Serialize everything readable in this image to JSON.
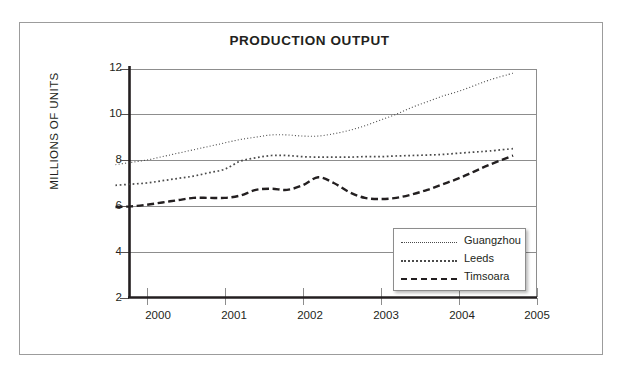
{
  "chart_data": {
    "type": "line",
    "title": "PRODUCTION OUTPUT",
    "xlabel": "",
    "ylabel": "MILLIONS OF UNITS",
    "xlim": [
      1999.78,
      2005
    ],
    "ylim": [
      2,
      12
    ],
    "yticks": [
      "2",
      "4",
      "6",
      "8",
      "10",
      "12"
    ],
    "ytick_values": [
      2,
      4,
      6,
      8,
      10,
      12
    ],
    "xticks": [
      "2000",
      "2001",
      "2002",
      "2003",
      "2004",
      "2005"
    ],
    "xtick_values": [
      2000,
      2001,
      2002,
      2003,
      2004,
      2005
    ],
    "grid": "horizontal",
    "legend_position": "lower-right",
    "x": [
      1999.6,
      1999.8,
      2000.0,
      2000.2,
      2000.4,
      2000.6,
      2000.8,
      2001.0,
      2001.2,
      2001.4,
      2001.6,
      2001.8,
      2002.0,
      2002.2,
      2002.4,
      2002.6,
      2002.8,
      2003.0,
      2003.2,
      2003.4,
      2003.6,
      2003.8,
      2004.0,
      2004.2,
      2004.4,
      2004.7
    ],
    "series": [
      {
        "name": "Guangzhou",
        "style": "fine-dotted",
        "color": "#4a4a4a",
        "values": [
          7.8,
          7.9,
          8.0,
          8.15,
          8.3,
          8.45,
          8.6,
          8.75,
          8.9,
          9.0,
          9.1,
          9.1,
          9.05,
          9.05,
          9.15,
          9.3,
          9.5,
          9.75,
          10.0,
          10.3,
          10.55,
          10.8,
          11.0,
          11.25,
          11.5,
          11.8
        ]
      },
      {
        "name": "Leeds",
        "style": "dotted",
        "color": "#4a4a4a",
        "values": [
          6.9,
          6.95,
          7.0,
          7.1,
          7.2,
          7.3,
          7.45,
          7.6,
          7.95,
          8.1,
          8.2,
          8.2,
          8.15,
          8.13,
          8.13,
          8.13,
          8.15,
          8.15,
          8.18,
          8.2,
          8.22,
          8.25,
          8.3,
          8.35,
          8.4,
          8.5
        ]
      },
      {
        "name": "Timsoara",
        "style": "dashed",
        "color": "#231f20",
        "values": [
          5.95,
          5.98,
          6.05,
          6.15,
          6.25,
          6.35,
          6.35,
          6.35,
          6.45,
          6.7,
          6.75,
          6.7,
          6.9,
          7.25,
          7.0,
          6.6,
          6.35,
          6.3,
          6.35,
          6.5,
          6.7,
          6.95,
          7.2,
          7.5,
          7.8,
          8.2
        ]
      }
    ]
  },
  "legend": {
    "items": [
      {
        "label": "Guangzhou"
      },
      {
        "label": "Leeds"
      },
      {
        "label": "Timsoara"
      }
    ]
  },
  "colors": {
    "axis": "#231f20",
    "grid": "#8d8d8d",
    "frame": "#9c9c9c",
    "text": "#231f20"
  }
}
